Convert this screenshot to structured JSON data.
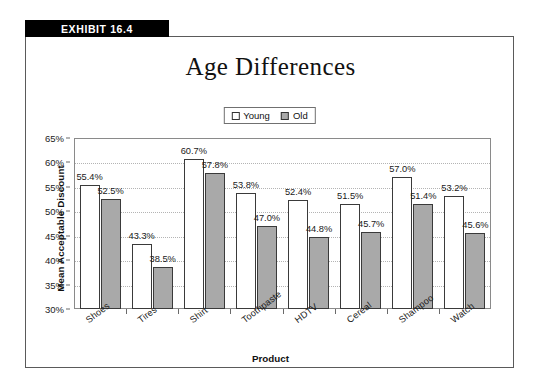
{
  "exhibit": {
    "banner_label": "EXHIBIT 16.4"
  },
  "chart_data": {
    "type": "bar",
    "title": "Age Differences",
    "xlabel": "Product",
    "ylabel": "Mean Acceptable Discount",
    "ylim": [
      30,
      65
    ],
    "ytick_labels": [
      "65%",
      "60%",
      "55%",
      "50%",
      "45%",
      "40%",
      "35%",
      "30%"
    ],
    "ytick_values": [
      65,
      60,
      55,
      50,
      45,
      40,
      35,
      30
    ],
    "grid": true,
    "legend_position": "top-center",
    "categories": [
      "Shoes",
      "Tires",
      "Shirt",
      "Toothpaste",
      "HDTV",
      "Cereal",
      "Shampoo",
      "Watch"
    ],
    "series": [
      {
        "name": "Young",
        "color": "#ffffff",
        "values": [
          55.4,
          43.3,
          60.7,
          53.8,
          52.4,
          51.5,
          57.0,
          53.2
        ],
        "labels": [
          "55.4%",
          "43.3%",
          "60.7%",
          "53.8%",
          "52.4%",
          "51.5%",
          "57.0%",
          "53.2%"
        ]
      },
      {
        "name": "Old",
        "color": "#a9a9a9",
        "values": [
          52.5,
          38.5,
          57.8,
          47.0,
          44.8,
          45.7,
          51.4,
          45.6
        ],
        "labels": [
          "52.5%",
          "38.5%",
          "57.8%",
          "47.0%",
          "44.8%",
          "45.7%",
          "51.4%",
          "45.6%"
        ]
      }
    ]
  }
}
